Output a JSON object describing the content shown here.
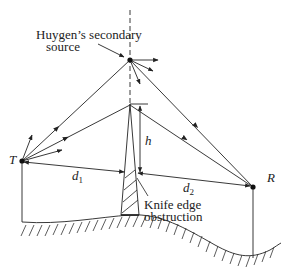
{
  "diagram": {
    "labels": {
      "huygen_line1": "Huygen’s secondary",
      "huygen_line2": "source",
      "transmitter": "T",
      "receiver": "R",
      "height": "h",
      "d1_base": "d",
      "d1_sub": "1",
      "d2_base": "d",
      "d2_sub": "2",
      "knife_line1": "Knife edge",
      "knife_line2": "obstruction"
    },
    "colors": {
      "stroke": "#222222",
      "background": "#ffffff"
    }
  }
}
